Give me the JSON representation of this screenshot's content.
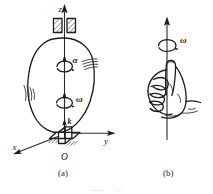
{
  "figure": {
    "panels": [
      {
        "id": "a",
        "caption": "(a)",
        "description": "Egg-shaped rigid body mounted on a vertical shaft between bearings, rotating about the z axis",
        "labels": {
          "z_axis": "z",
          "y_axis": "y",
          "x_axis": "x",
          "origin": "O",
          "angular_acceleration": "α",
          "angular_velocity": "ω",
          "unit_vector": "k"
        }
      },
      {
        "id": "b",
        "caption": "(b)",
        "description": "Right hand curled around the axis with thumb pointing up along the angular velocity vector",
        "labels": {
          "angular_velocity": "ω"
        }
      }
    ],
    "colors": {
      "ink": "#1c1c1c",
      "ink_light": "#4a4a4a",
      "background": "#ffffff"
    }
  }
}
